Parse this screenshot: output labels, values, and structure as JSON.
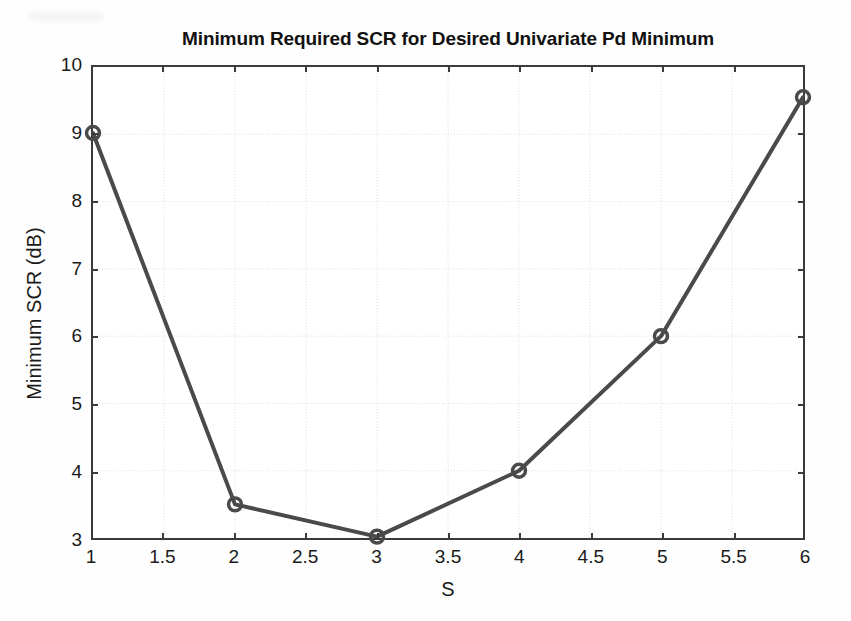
{
  "chart_data": {
    "type": "line",
    "title": "Minimum Required SCR for Desired Univariate Pd Minimum",
    "xlabel": "S",
    "ylabel": "Minimum SCR (dB)",
    "xlim": [
      1,
      6
    ],
    "ylim": [
      3,
      10
    ],
    "grid": true,
    "legend": null,
    "x": [
      1,
      2,
      3,
      4,
      5,
      6
    ],
    "values": [
      9.02,
      3.5,
      3.02,
      4.0,
      6.0,
      9.55
    ],
    "series": [
      {
        "name": "Minimum Required SCR",
        "x": [
          1,
          2,
          3,
          4,
          5,
          6
        ],
        "values": [
          9.02,
          3.5,
          3.02,
          4.0,
          6.0,
          9.55
        ],
        "line_color": "#4a4a4a",
        "marker": "circle-open",
        "marker_color": "#4a4a4a"
      }
    ],
    "xticks": [
      1,
      1.5,
      2,
      2.5,
      3,
      3.5,
      4,
      4.5,
      5,
      5.5,
      6
    ],
    "xtick_labels": [
      "1",
      "1.5",
      "2",
      "2.5",
      "3",
      "3.5",
      "4",
      "4.5",
      "5",
      "5.5",
      "6"
    ],
    "yticks": [
      3,
      4,
      5,
      6,
      7,
      8,
      9,
      10
    ],
    "ytick_labels": [
      "3",
      "4",
      "5",
      "6",
      "7",
      "8",
      "9",
      "10"
    ],
    "colors": {
      "line": "#4a4a4a",
      "axis": "#3b3b3b",
      "grid": "#dcdcdc",
      "background": "#ffffff",
      "text": "#1a1a1a"
    }
  }
}
